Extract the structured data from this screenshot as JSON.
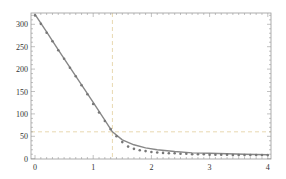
{
  "chart_data": {
    "type": "line",
    "title": "",
    "xlabel": "",
    "ylabel": "",
    "xlim": [
      0,
      4.05
    ],
    "ylim": [
      0,
      327
    ],
    "grid": false,
    "legend": null,
    "x_ticks": [
      "0",
      "1",
      "2",
      "3",
      "4"
    ],
    "y_ticks": [
      "0",
      "50",
      "100",
      "150",
      "200",
      "250",
      "300"
    ],
    "reference_lines": {
      "vertical_x": 1.33,
      "horizontal_y": 60,
      "style": "dashed",
      "color": "#e8d8b0"
    },
    "series": [
      {
        "name": "fit curve",
        "style": "line",
        "color": "#888888",
        "x": [
          0,
          0.2,
          0.4,
          0.6,
          0.8,
          1.0,
          1.2,
          1.33,
          1.5,
          1.7,
          1.9,
          2.1,
          2.4,
          2.7,
          3.0,
          3.3,
          3.6,
          4.0
        ],
        "values": [
          322,
          283,
          243,
          204,
          165,
          126,
          86,
          60,
          42,
          31,
          24,
          20,
          16,
          13,
          12,
          11,
          10,
          9
        ]
      },
      {
        "name": "data points",
        "style": "scatter",
        "color": "#777777",
        "x": [
          0.0,
          0.1,
          0.2,
          0.3,
          0.4,
          0.5,
          0.6,
          0.7,
          0.8,
          0.9,
          1.0,
          1.1,
          1.2,
          1.3,
          1.4,
          1.5,
          1.6,
          1.7,
          1.8,
          1.9,
          2.0,
          2.1,
          2.2,
          2.3,
          2.4,
          2.5,
          2.6,
          2.7,
          2.8,
          2.9,
          3.0,
          3.1,
          3.2,
          3.3,
          3.4,
          3.5,
          3.6,
          3.7,
          3.8,
          3.9,
          4.0
        ],
        "values": [
          320,
          301,
          281,
          262,
          242,
          223,
          203,
          184,
          164,
          144,
          122,
          103,
          84,
          66,
          50,
          37,
          27,
          22,
          19,
          17,
          15,
          14,
          13,
          12,
          12,
          11,
          11,
          10,
          10,
          10,
          9,
          9,
          9,
          9,
          8,
          8,
          8,
          8,
          8,
          8,
          8
        ]
      }
    ]
  },
  "axes": {
    "x_tick_labels": [
      "0",
      "1",
      "2",
      "3",
      "4"
    ],
    "y_tick_labels": [
      "0",
      "50",
      "100",
      "150",
      "200",
      "250",
      "300"
    ]
  }
}
